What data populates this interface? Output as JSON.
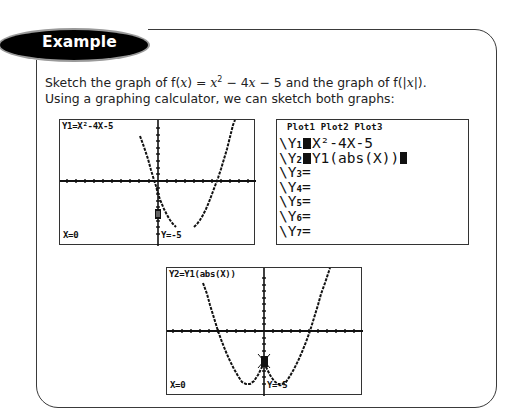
{
  "header": {
    "label": "Example"
  },
  "body": {
    "line1": {
      "prefix": "Sketch the graph of ",
      "f1": "f(",
      "x1": "x",
      "f1_close": ") = ",
      "x2": "x",
      "sup": "2",
      "rest": " − 4",
      "x3": "x",
      "tail": " − 5  and the graph of  f(|",
      "x4": "x",
      "end": "|)."
    },
    "line2": "Using a graphing calculator, we can sketch both graphs:"
  },
  "screens": {
    "graph1": {
      "title": "Y1=X²-4X-5",
      "x_readout": "X=0",
      "y_readout": "Y=-5"
    },
    "equation_editor": {
      "plots": "Plot1  Plot2  Plot3",
      "rows": [
        {
          "prefix": "\\Y",
          "sub": "1",
          "expr": "X²-4X-5",
          "selected": true
        },
        {
          "prefix": "\\Y",
          "sub": "2",
          "expr": "Y1(abs(X))",
          "selected": true,
          "cursor": true
        },
        {
          "prefix": "\\Y",
          "sub": "3",
          "expr": "=",
          "selected": false
        },
        {
          "prefix": "\\Y",
          "sub": "4",
          "expr": "=",
          "selected": false
        },
        {
          "prefix": "\\Y",
          "sub": "5",
          "expr": "=",
          "selected": false
        },
        {
          "prefix": "\\Y",
          "sub": "6",
          "expr": "=",
          "selected": false
        },
        {
          "prefix": "\\Y",
          "sub": "7",
          "expr": "=",
          "selected": false
        }
      ]
    },
    "graph2": {
      "title": "Y2=Y1(abs(X))",
      "x_readout": "X=0",
      "y_readout": "Y=-5"
    }
  },
  "colors": {
    "pill_bg": "#000000",
    "pill_outline": "#9a9a9a",
    "frame_border": "#3a3a3a",
    "lcd_ink": "#111111"
  }
}
